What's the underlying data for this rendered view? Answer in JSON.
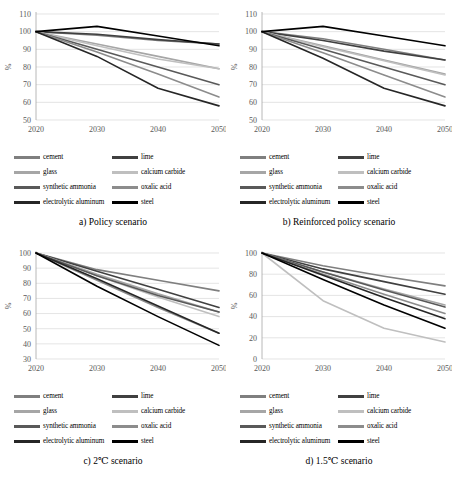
{
  "figure": {
    "panel_count": 4
  },
  "legend": {
    "items": [
      {
        "label": "cement",
        "color": "#7f7f7f"
      },
      {
        "label": "lime",
        "color": "#404040"
      },
      {
        "label": "glass",
        "color": "#a6a6a6"
      },
      {
        "label": "calcium carbide",
        "color": "#bfbfbf"
      },
      {
        "label": "synthetic ammonia",
        "color": "#595959"
      },
      {
        "label": "oxalic acid",
        "color": "#8c8c8c"
      },
      {
        "label": "electrolytic aluminum",
        "color": "#262626"
      },
      {
        "label": "steel",
        "color": "#000000"
      }
    ]
  },
  "chart_data": [
    {
      "type": "line",
      "id": "policy",
      "title": "a) Policy scenario",
      "xlabel": "",
      "ylabel": "%",
      "x": [
        "2020",
        "2030",
        "2040",
        "2050"
      ],
      "ylim": [
        50,
        110
      ],
      "yticks": [
        50,
        60,
        70,
        80,
        90,
        100,
        110
      ],
      "grid": true,
      "legend_position": "bottom",
      "series": [
        {
          "name": "cement",
          "values": [
            100,
            98,
            95,
            93
          ]
        },
        {
          "name": "lime",
          "values": [
            100,
            98.5,
            95.5,
            93
          ]
        },
        {
          "name": "glass",
          "values": [
            100,
            93,
            86,
            79
          ]
        },
        {
          "name": "calcium carbide",
          "values": [
            100,
            92,
            84.5,
            79
          ]
        },
        {
          "name": "synthetic ammonia",
          "values": [
            100,
            90,
            80,
            70
          ]
        },
        {
          "name": "oxalic acid",
          "values": [
            100,
            88.5,
            76,
            63
          ]
        },
        {
          "name": "electrolytic aluminum",
          "values": [
            100,
            86,
            68,
            58
          ]
        },
        {
          "name": "steel",
          "values": [
            100,
            103,
            97.5,
            92
          ]
        }
      ]
    },
    {
      "type": "line",
      "id": "reinforced-policy",
      "title": "b) Reinforced policy scenario",
      "xlabel": "",
      "ylabel": "%",
      "x": [
        "2020",
        "2030",
        "2040",
        "2050"
      ],
      "ylim": [
        50,
        110
      ],
      "yticks": [
        50,
        60,
        70,
        80,
        90,
        100,
        110
      ],
      "grid": true,
      "legend_position": "bottom",
      "series": [
        {
          "name": "cement",
          "values": [
            100,
            96,
            90,
            84
          ]
        },
        {
          "name": "lime",
          "values": [
            100,
            95,
            89,
            84
          ]
        },
        {
          "name": "glass",
          "values": [
            100,
            92,
            84,
            76
          ]
        },
        {
          "name": "calcium carbide",
          "values": [
            100,
            91.5,
            83.5,
            75.5
          ]
        },
        {
          "name": "synthetic ammonia",
          "values": [
            100,
            90,
            80,
            70
          ]
        },
        {
          "name": "oxalic acid",
          "values": [
            100,
            88,
            75.5,
            63
          ]
        },
        {
          "name": "electrolytic aluminum",
          "values": [
            100,
            85,
            68,
            58
          ]
        },
        {
          "name": "steel",
          "values": [
            100,
            103,
            97.5,
            92
          ]
        }
      ]
    },
    {
      "type": "line",
      "id": "two-degree",
      "title": "c) 2℃ scenario",
      "xlabel": "",
      "ylabel": "%",
      "x": [
        "2020",
        "2030",
        "2040",
        "2050"
      ],
      "ylim": [
        30,
        100
      ],
      "yticks": [
        30,
        40,
        50,
        60,
        70,
        80,
        90,
        100
      ],
      "grid": true,
      "legend_position": "bottom",
      "series": [
        {
          "name": "cement",
          "values": [
            100,
            89,
            82,
            75
          ]
        },
        {
          "name": "lime",
          "values": [
            100,
            88,
            76,
            64
          ]
        },
        {
          "name": "glass",
          "values": [
            100,
            86,
            73,
            61
          ]
        },
        {
          "name": "calcium carbide",
          "values": [
            100,
            85,
            71,
            58
          ]
        },
        {
          "name": "synthetic ammonia",
          "values": [
            100,
            85,
            72,
            61
          ]
        },
        {
          "name": "oxalic acid",
          "values": [
            100,
            82,
            64,
            47
          ]
        },
        {
          "name": "electrolytic aluminum",
          "values": [
            100,
            83,
            65,
            47
          ]
        },
        {
          "name": "steel",
          "values": [
            100,
            78,
            58,
            39
          ]
        }
      ]
    },
    {
      "type": "line",
      "id": "one-point-five-degree",
      "title": "d) 1.5℃ scenario",
      "xlabel": "",
      "ylabel": "%",
      "x": [
        "2020",
        "2030",
        "2040",
        "2050"
      ],
      "ylim": [
        0,
        100
      ],
      "yticks": [
        0,
        20,
        40,
        60,
        80,
        100
      ],
      "grid": true,
      "legend_position": "bottom",
      "series": [
        {
          "name": "cement",
          "values": [
            100,
            88,
            78,
            69
          ]
        },
        {
          "name": "lime",
          "values": [
            100,
            85,
            73,
            61
          ]
        },
        {
          "name": "glass",
          "values": [
            100,
            82,
            66,
            51
          ]
        },
        {
          "name": "calcium carbide",
          "values": [
            100,
            55,
            29,
            16
          ]
        },
        {
          "name": "synthetic ammonia",
          "values": [
            100,
            82,
            65,
            49
          ]
        },
        {
          "name": "oxalic acid",
          "values": [
            100,
            80,
            61,
            43
          ]
        },
        {
          "name": "electrolytic aluminum",
          "values": [
            100,
            79,
            58,
            38
          ]
        },
        {
          "name": "steel",
          "values": [
            100,
            75,
            51,
            29
          ]
        }
      ]
    }
  ]
}
